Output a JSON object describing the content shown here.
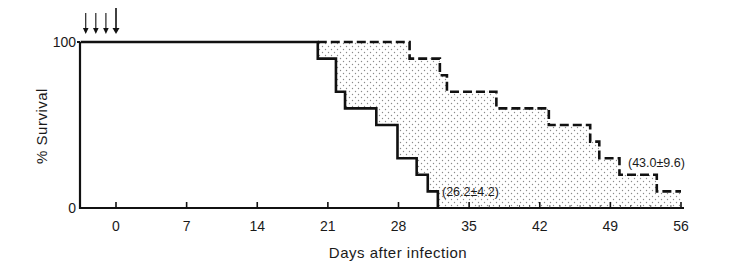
{
  "chart_data": {
    "type": "line",
    "subtype": "kaplan-meier-step",
    "title": "",
    "xlabel": "Days after infection",
    "ylabel": "% Survival",
    "xlim": [
      -5,
      57
    ],
    "ylim": [
      0,
      100
    ],
    "x_ticks": [
      0,
      7,
      14,
      21,
      28,
      35,
      42,
      49,
      56
    ],
    "x_tick_labels": [
      "0",
      "7",
      "14",
      "21",
      "28",
      "35",
      "42",
      "49",
      "56"
    ],
    "y_ticks": [
      0,
      100
    ],
    "y_tick_labels": [
      "0",
      "100"
    ],
    "grid": false,
    "legend": null,
    "treatment_arrows_days": [
      -3,
      -2,
      -1,
      0
    ],
    "shaded_region": "between curves (stippled)",
    "series": [
      {
        "name": "control (solid)",
        "style": "solid",
        "annotation": "(26.2±4.2)",
        "steps": [
          {
            "x": -3.5,
            "y": 100
          },
          {
            "x": 20,
            "y": 90
          },
          {
            "x": 21.8,
            "y": 70
          },
          {
            "x": 22.7,
            "y": 60
          },
          {
            "x": 25.8,
            "y": 50
          },
          {
            "x": 27.9,
            "y": 30
          },
          {
            "x": 29.8,
            "y": 20
          },
          {
            "x": 30.9,
            "y": 10
          },
          {
            "x": 31.9,
            "y": 0
          }
        ]
      },
      {
        "name": "treated (dashed)",
        "style": "dashed",
        "annotation": "(43.0±9.6)",
        "steps": [
          {
            "x": 20,
            "y": 100
          },
          {
            "x": 29.1,
            "y": 90
          },
          {
            "x": 32.1,
            "y": 80
          },
          {
            "x": 32.8,
            "y": 70
          },
          {
            "x": 37.7,
            "y": 60
          },
          {
            "x": 42.9,
            "y": 50
          },
          {
            "x": 47.0,
            "y": 40
          },
          {
            "x": 47.9,
            "y": 30
          },
          {
            "x": 49.9,
            "y": 20
          },
          {
            "x": 53.6,
            "y": 10
          },
          {
            "x": 56.0,
            "y": 10
          }
        ]
      }
    ]
  },
  "labels": {
    "ylabel": "% Survival",
    "xlabel": "Days after infection",
    "y_top": "100",
    "y_bottom": "0",
    "annot_control": "(26.2±4.2)",
    "annot_treated": "(43.0±9.6)"
  }
}
